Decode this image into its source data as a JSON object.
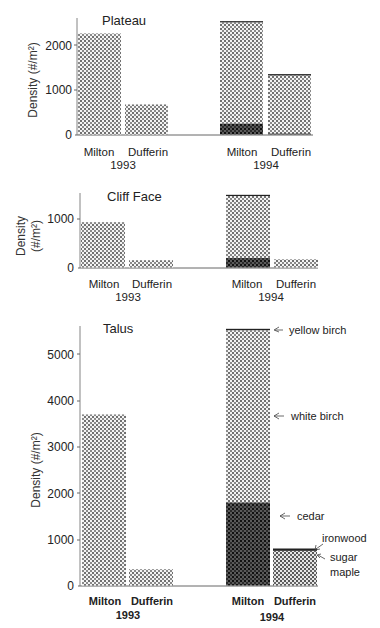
{
  "chart_data": [
    {
      "type": "bar",
      "stacked": true,
      "title": "Plateau",
      "xlabel": "",
      "ylabel": "Density (#/m²)",
      "ylim": [
        0,
        2600
      ],
      "yticks": [
        0,
        1000,
        2000
      ],
      "groups": [
        "1993",
        "1994"
      ],
      "categories": [
        "Milton",
        "Dufferin",
        "Milton",
        "Dufferin"
      ],
      "category_groups": [
        "1993",
        "1993",
        "1994",
        "1994"
      ],
      "series": [
        {
          "name": "cedar",
          "values": [
            0,
            0,
            250,
            20
          ]
        },
        {
          "name": "sugar maple",
          "values": [
            0,
            0,
            0,
            0
          ]
        },
        {
          "name": "white birch",
          "values": [
            2270,
            675,
            2270,
            1300
          ]
        },
        {
          "name": "ironwood",
          "values": [
            0,
            0,
            0,
            30
          ]
        },
        {
          "name": "yellow birch",
          "values": [
            0,
            0,
            20,
            0
          ]
        }
      ],
      "totals": [
        2270,
        675,
        2540,
        1350
      ],
      "grid": false
    },
    {
      "type": "bar",
      "stacked": true,
      "title": "Cliff Face",
      "xlabel": "",
      "ylabel": "Density (#/m²)",
      "ylim": [
        0,
        1500
      ],
      "yticks": [
        0,
        1000
      ],
      "groups": [
        "1993",
        "1994"
      ],
      "categories": [
        "Milton",
        "Dufferin",
        "Milton",
        "Dufferin"
      ],
      "category_groups": [
        "1993",
        "1993",
        "1994",
        "1994"
      ],
      "series": [
        {
          "name": "cedar",
          "values": [
            0,
            0,
            200,
            0
          ]
        },
        {
          "name": "white birch",
          "values": [
            940,
            150,
            1280,
            170
          ]
        },
        {
          "name": "yellow birch",
          "values": [
            0,
            0,
            20,
            0
          ]
        }
      ],
      "totals": [
        940,
        150,
        1500,
        170
      ],
      "grid": false
    },
    {
      "type": "bar",
      "stacked": true,
      "title": "Talus",
      "xlabel": "",
      "ylabel": "Density (#/m²)",
      "ylim": [
        0,
        5600
      ],
      "yticks": [
        0,
        1000,
        2000,
        3000,
        4000,
        5000
      ],
      "groups": [
        "1993",
        "1994"
      ],
      "categories": [
        "Milton",
        "Dufferin",
        "Milton",
        "Dufferin"
      ],
      "category_groups": [
        "1993",
        "1993",
        "1994",
        "1994"
      ],
      "series": [
        {
          "name": "cedar",
          "values": [
            0,
            0,
            1800,
            0
          ]
        },
        {
          "name": "sugar maple",
          "values": [
            0,
            0,
            0,
            750
          ]
        },
        {
          "name": "white birch",
          "values": [
            3700,
            350,
            3720,
            0
          ]
        },
        {
          "name": "ironwood",
          "values": [
            0,
            0,
            0,
            50
          ]
        },
        {
          "name": "yellow birch",
          "values": [
            0,
            0,
            30,
            0
          ]
        }
      ],
      "totals": [
        3700,
        350,
        5550,
        800
      ],
      "annotations": [
        "yellow birch",
        "white birch",
        "cedar",
        "ironwood",
        "sugar maple"
      ],
      "grid": false
    }
  ],
  "panels": [
    {
      "id": "plateau",
      "title": "Plateau",
      "ylabel_lines": [
        "Density (#/m²)"
      ],
      "ytick_labels": [
        "0",
        "1000",
        "2000"
      ],
      "x_labels": [
        "Milton",
        "Dufferin",
        "Milton",
        "Dufferin"
      ],
      "group_labels": [
        "1993",
        "1994"
      ]
    },
    {
      "id": "cliff-face",
      "title": "Cliff Face",
      "ylabel_lines": [
        "Density",
        "(#/m²)"
      ],
      "ytick_labels": [
        "0",
        "1000"
      ],
      "x_labels": [
        "Milton",
        "Dufferin",
        "Milton",
        "Dufferin"
      ],
      "group_labels": [
        "1993",
        "1994"
      ]
    },
    {
      "id": "talus",
      "title": "Talus",
      "ylabel_lines": [
        "Density (#/m²)"
      ],
      "ytick_labels": [
        "0",
        "1000",
        "2000",
        "3000",
        "4000",
        "5000"
      ],
      "x_labels": [
        "Milton",
        "Dufferin",
        "Milton",
        "Dufferin"
      ],
      "group_labels": [
        "1993",
        "1994"
      ],
      "annotations": [
        {
          "label": "yellow birch"
        },
        {
          "label": "white birch"
        },
        {
          "label": "cedar"
        },
        {
          "label": "ironwood"
        },
        {
          "label": "sugar maple",
          "lines": [
            "sugar",
            "maple"
          ]
        }
      ]
    }
  ],
  "colors": {
    "ink": "#222222",
    "axis": "#555555",
    "light_pattern_bg": "#f2f2f2",
    "light_pattern_dot": "#6a6a6a",
    "dark_pattern_bg": "#555555",
    "dark_pattern_dot": "#1a1a1a"
  }
}
